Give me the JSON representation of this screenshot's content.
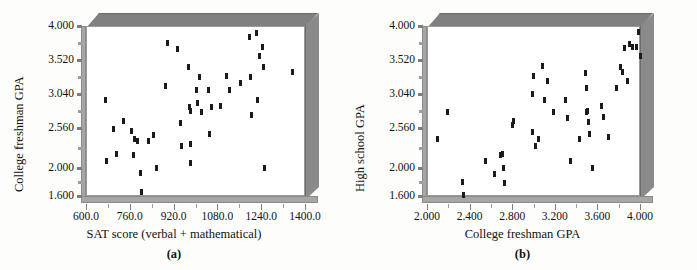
{
  "figure": {
    "background_color": "#fdfdfb",
    "marker_color": "#1b1b1b",
    "frame_color": "#808080",
    "plot_background": "#ffffff"
  },
  "panels": [
    {
      "key": "a",
      "caption": "(a)",
      "xlabel": "SAT score (verbal + mathematical)",
      "ylabel": "College freshman GPA"
    },
    {
      "key": "b",
      "caption": "(b)",
      "xlabel": "College freshman GPA",
      "ylabel": "High school GPA"
    }
  ],
  "chart_data": [
    {
      "type": "scatter",
      "panel": "a",
      "title": "",
      "xlabel": "SAT score (verbal + mathematical)",
      "ylabel": "College freshman GPA",
      "xlim": [
        600.0,
        1400.0
      ],
      "ylim": [
        1.6,
        4.0
      ],
      "xticks": [
        600.0,
        760.0,
        920.0,
        1080.0,
        1240.0,
        1400.0
      ],
      "xticklabels": [
        "600.0",
        "760.0",
        "920.0",
        "1080.0",
        "1240.0",
        "1400.0"
      ],
      "yticks": [
        1.6,
        2.0,
        2.56,
        3.04,
        3.52,
        4.0
      ],
      "yticklabels": [
        "1.600",
        "2.000",
        "2.560",
        "3.040",
        "3.520",
        "4.000"
      ],
      "y_minor_ticks": [
        1.8,
        2.28,
        2.8,
        3.28,
        3.76
      ],
      "x_minor_ticks": [
        680.0,
        840.0,
        1000.0,
        1160.0,
        1320.0
      ],
      "grid": false,
      "legend": null,
      "points": [
        [
          672,
          2.96
        ],
        [
          676,
          2.1
        ],
        [
          700,
          2.55
        ],
        [
          712,
          2.19
        ],
        [
          737,
          2.66
        ],
        [
          765,
          2.52
        ],
        [
          774,
          2.18
        ],
        [
          778,
          2.4
        ],
        [
          787,
          2.38
        ],
        [
          800,
          1.92
        ],
        [
          802,
          1.66
        ],
        [
          830,
          2.38
        ],
        [
          848,
          2.46
        ],
        [
          856,
          2.0
        ],
        [
          892,
          3.16
        ],
        [
          896,
          3.76
        ],
        [
          934,
          3.67
        ],
        [
          944,
          2.63
        ],
        [
          948,
          2.3
        ],
        [
          975,
          3.42
        ],
        [
          978,
          2.85
        ],
        [
          980,
          2.8
        ],
        [
          981,
          2.33
        ],
        [
          982,
          2.07
        ],
        [
          1004,
          3.1
        ],
        [
          1007,
          2.92
        ],
        [
          1014,
          3.28
        ],
        [
          1021,
          2.78
        ],
        [
          1048,
          3.1
        ],
        [
          1052,
          2.47
        ],
        [
          1059,
          2.85
        ],
        [
          1090,
          2.87
        ],
        [
          1113,
          3.3
        ],
        [
          1126,
          3.1
        ],
        [
          1165,
          3.19
        ],
        [
          1196,
          3.84
        ],
        [
          1200,
          3.28
        ],
        [
          1206,
          2.74
        ],
        [
          1222,
          3.9
        ],
        [
          1226,
          2.95
        ],
        [
          1232,
          3.57
        ],
        [
          1243,
          3.7
        ],
        [
          1247,
          3.42
        ],
        [
          1252,
          2.0
        ],
        [
          1355,
          3.35
        ]
      ]
    },
    {
      "type": "scatter",
      "panel": "b",
      "title": "",
      "xlabel": "College freshman GPA",
      "ylabel": "High school GPA",
      "xlim": [
        2.0,
        4.0
      ],
      "ylim": [
        1.6,
        4.0
      ],
      "xticks": [
        2.0,
        2.4,
        2.8,
        3.2,
        3.6,
        4.0
      ],
      "xticklabels": [
        "2.000",
        "2.400",
        "2.800",
        "3.200",
        "3.600",
        "4.000"
      ],
      "yticks": [
        1.6,
        2.0,
        2.56,
        3.04,
        3.52,
        4.0
      ],
      "yticklabels": [
        "1.600",
        "2.000",
        "2.560",
        "3.040",
        "3.520",
        "4.000"
      ],
      "y_minor_ticks": [
        1.8,
        2.28,
        2.8,
        3.28,
        3.76
      ],
      "x_minor_ticks": [
        2.2,
        2.6,
        3.0,
        3.4,
        3.8
      ],
      "grid": false,
      "legend": null,
      "points": [
        [
          2.1,
          2.4
        ],
        [
          2.19,
          2.79
        ],
        [
          2.33,
          1.8
        ],
        [
          2.34,
          1.62
        ],
        [
          2.55,
          2.1
        ],
        [
          2.63,
          1.91
        ],
        [
          2.69,
          2.18
        ],
        [
          2.71,
          2.2
        ],
        [
          2.72,
          2.0
        ],
        [
          2.73,
          1.78
        ],
        [
          2.8,
          2.6
        ],
        [
          2.81,
          2.66
        ],
        [
          2.99,
          3.04
        ],
        [
          2.99,
          2.5
        ],
        [
          3.0,
          3.3
        ],
        [
          3.02,
          2.3
        ],
        [
          3.05,
          2.4
        ],
        [
          3.08,
          3.44
        ],
        [
          3.1,
          2.96
        ],
        [
          3.13,
          3.22
        ],
        [
          3.19,
          2.79
        ],
        [
          3.3,
          2.96
        ],
        [
          3.32,
          2.7
        ],
        [
          3.35,
          2.1
        ],
        [
          3.43,
          2.4
        ],
        [
          3.49,
          3.33
        ],
        [
          3.5,
          3.12
        ],
        [
          3.5,
          2.78
        ],
        [
          3.51,
          2.8
        ],
        [
          3.52,
          2.65
        ],
        [
          3.53,
          2.47
        ],
        [
          3.55,
          2.0
        ],
        [
          3.64,
          2.87
        ],
        [
          3.66,
          2.72
        ],
        [
          3.7,
          2.44
        ],
        [
          3.78,
          3.13
        ],
        [
          3.82,
          3.42
        ],
        [
          3.84,
          3.35
        ],
        [
          3.85,
          3.69
        ],
        [
          3.88,
          3.23
        ],
        [
          3.9,
          3.75
        ],
        [
          3.93,
          3.7
        ],
        [
          3.97,
          3.71
        ],
        [
          3.99,
          3.91
        ],
        [
          4.0,
          3.58
        ]
      ]
    }
  ]
}
